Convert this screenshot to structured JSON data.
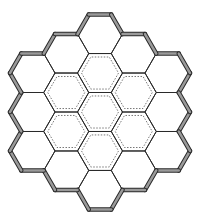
{
  "diagram": {
    "type": "hexagonal-honeycomb",
    "hex_orientation": "flat-top",
    "center": [
      100,
      112
    ],
    "side": 22.5,
    "colors": {
      "background": "#ffffff",
      "line": "#2a2a2a",
      "wall_fill": "#9a9a9a",
      "dotted": "#555555"
    },
    "rings": [
      {
        "name": "center",
        "count": 1
      },
      {
        "name": "inner-ring",
        "count": 6
      },
      {
        "name": "outer-ring",
        "count": 12
      }
    ],
    "cells": [
      {
        "q": 0,
        "r": 0,
        "ring": 0
      },
      {
        "q": 1,
        "r": -1,
        "ring": 1
      },
      {
        "q": 1,
        "r": 0,
        "ring": 1
      },
      {
        "q": 0,
        "r": 1,
        "ring": 1
      },
      {
        "q": -1,
        "r": 1,
        "ring": 1
      },
      {
        "q": -1,
        "r": 0,
        "ring": 1
      },
      {
        "q": 0,
        "r": -1,
        "ring": 1
      },
      {
        "q": 2,
        "r": -2,
        "ring": 2
      },
      {
        "q": 2,
        "r": -1,
        "ring": 2
      },
      {
        "q": 2,
        "r": 0,
        "ring": 2
      },
      {
        "q": 1,
        "r": 1,
        "ring": 2
      },
      {
        "q": 0,
        "r": 2,
        "ring": 2
      },
      {
        "q": -1,
        "r": 2,
        "ring": 2
      },
      {
        "q": -2,
        "r": 2,
        "ring": 2
      },
      {
        "q": -2,
        "r": 1,
        "ring": 2
      },
      {
        "q": -2,
        "r": 0,
        "ring": 2
      },
      {
        "q": -1,
        "r": -1,
        "ring": 2
      },
      {
        "q": 0,
        "r": -2,
        "ring": 2
      },
      {
        "q": 1,
        "r": -2,
        "ring": 2
      }
    ]
  }
}
